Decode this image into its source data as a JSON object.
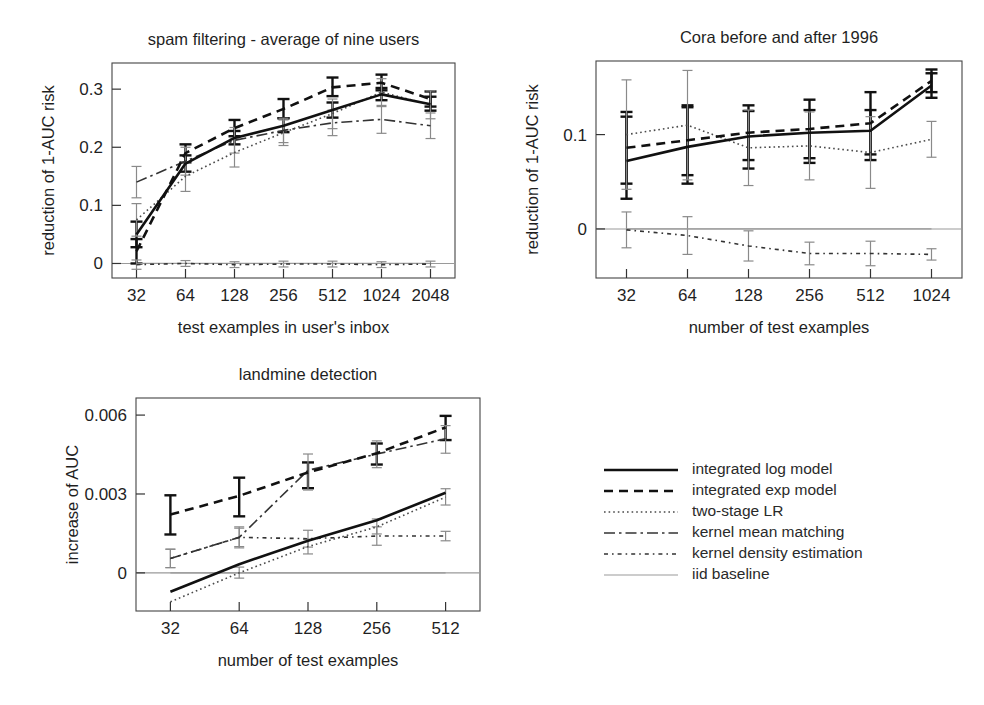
{
  "figure": {
    "width": 984,
    "height": 705,
    "background": "#ffffff"
  },
  "series_styles": {
    "integrated_log_model": {
      "color": "#111111",
      "width": 2.6,
      "dash": "none"
    },
    "integrated_exp_model": {
      "color": "#111111",
      "width": 2.6,
      "dash": "9,6"
    },
    "two_stage_lr": {
      "color": "#4a4a4a",
      "width": 1.6,
      "dash": "1.6,3"
    },
    "kernel_mean_matching": {
      "color": "#333333",
      "width": 1.6,
      "dash": "11,4,2.5,4"
    },
    "kernel_density_estimation": {
      "color": "#333333",
      "width": 1.6,
      "dash": "4,4,1.6,4"
    },
    "iid_baseline": {
      "color": "#9a9a9a",
      "width": 1.2,
      "dash": "none"
    }
  },
  "legend": {
    "x": 604,
    "y": 470,
    "row_height": 21,
    "sample_width": 74,
    "text_offset": 88,
    "items": [
      {
        "key": "integrated_log_model",
        "label": "integrated log model"
      },
      {
        "key": "integrated_exp_model",
        "label": "integrated exp model"
      },
      {
        "key": "two_stage_lr",
        "label": "two-stage LR"
      },
      {
        "key": "kernel_mean_matching",
        "label": "kernel mean matching"
      },
      {
        "key": "kernel_density_estimation",
        "label": "kernel density estimation"
      },
      {
        "key": "iid_baseline",
        "label": "iid baseline"
      }
    ]
  },
  "chart_data": [
    {
      "id": "spam-filtering",
      "type": "line",
      "title": "spam filtering - average of nine users",
      "xlabel": "test examples in user's inbox",
      "ylabel": "reduction of 1-AUC risk",
      "categories": [
        "32",
        "64",
        "128",
        "256",
        "512",
        "1024",
        "2048"
      ],
      "yticks": [
        0,
        0.1,
        0.2,
        0.3
      ],
      "ytick_labels": [
        "0",
        "0.1",
        "0.2",
        "0.3"
      ],
      "ylim": [
        -0.025,
        0.345
      ],
      "grid": false,
      "zero_line": true,
      "legend_position": "external-bottom-right",
      "plot_box": {
        "left": 112,
        "top": 63,
        "right": 455,
        "bottom": 278
      },
      "series": [
        {
          "name": "integrated log model",
          "key": "integrated_log_model",
          "values": [
            0.05,
            0.172,
            0.216,
            0.237,
            0.264,
            0.291,
            0.274
          ],
          "err_lo": [
            0.028,
            0.158,
            0.205,
            0.226,
            0.251,
            0.281,
            0.263
          ],
          "err_hi": [
            0.072,
            0.186,
            0.228,
            0.25,
            0.277,
            0.302,
            0.287
          ]
        },
        {
          "name": "integrated exp model",
          "key": "integrated_exp_model",
          "values": [
            0.021,
            0.19,
            0.233,
            0.266,
            0.303,
            0.311,
            0.283
          ],
          "err_lo": [
            0.0,
            0.174,
            0.219,
            0.25,
            0.288,
            0.298,
            0.27
          ],
          "err_hi": [
            0.042,
            0.205,
            0.247,
            0.283,
            0.32,
            0.325,
            0.296
          ]
        },
        {
          "name": "two-stage LR",
          "key": "two_stage_lr",
          "values": [
            0.075,
            0.15,
            0.191,
            0.225,
            0.258,
            0.295,
            0.273
          ],
          "err_lo": [
            0.047,
            0.124,
            0.166,
            0.203,
            0.232,
            0.272,
            0.249
          ],
          "err_hi": [
            0.103,
            0.175,
            0.214,
            0.247,
            0.283,
            0.318,
            0.297
          ]
        },
        {
          "name": "kernel mean matching",
          "key": "kernel_mean_matching",
          "values": [
            0.14,
            0.176,
            0.212,
            0.229,
            0.242,
            0.248,
            0.237
          ],
          "err_lo": [
            0.113,
            0.152,
            0.19,
            0.208,
            0.22,
            0.224,
            0.215
          ],
          "err_hi": [
            0.167,
            0.2,
            0.234,
            0.25,
            0.264,
            0.27,
            0.259
          ]
        },
        {
          "name": "kernel density estimation",
          "key": "kernel_density_estimation",
          "values": [
            -0.002,
            0.0,
            -0.002,
            -0.001,
            -0.001,
            -0.002,
            -0.001
          ],
          "err_lo": [
            -0.01,
            -0.005,
            -0.007,
            -0.006,
            -0.006,
            -0.007,
            -0.006
          ],
          "err_hi": [
            0.006,
            0.005,
            0.003,
            0.004,
            0.004,
            0.003,
            0.004
          ]
        },
        {
          "name": "iid baseline",
          "key": "iid_baseline",
          "values": [
            0,
            0,
            0,
            0,
            0,
            0,
            0
          ]
        }
      ]
    },
    {
      "id": "cora",
      "type": "line",
      "title": "Cora before and after 1996",
      "xlabel": "number of test examples",
      "ylabel": "reduction of 1-AUC risk",
      "categories": [
        "32",
        "64",
        "128",
        "256",
        "512",
        "1024"
      ],
      "yticks": [
        0,
        0.1
      ],
      "ytick_labels": [
        "0",
        "0.1"
      ],
      "ylim": [
        -0.052,
        0.178
      ],
      "grid": false,
      "zero_line": true,
      "legend_position": "external-bottom-right",
      "plot_box": {
        "left": 596,
        "top": 61,
        "right": 962,
        "bottom": 278
      },
      "series": [
        {
          "name": "integrated log model",
          "key": "integrated_log_model",
          "values": [
            0.072,
            0.087,
            0.098,
            0.102,
            0.104,
            0.152
          ],
          "err_lo": [
            0.032,
            0.048,
            0.064,
            0.07,
            0.073,
            0.139
          ],
          "err_hi": [
            0.119,
            0.129,
            0.125,
            0.126,
            0.126,
            0.165
          ]
        },
        {
          "name": "integrated exp model",
          "key": "integrated_exp_model",
          "values": [
            0.086,
            0.094,
            0.102,
            0.106,
            0.112,
            0.157
          ],
          "err_lo": [
            0.048,
            0.057,
            0.073,
            0.075,
            0.079,
            0.145
          ],
          "err_hi": [
            0.124,
            0.131,
            0.131,
            0.137,
            0.145,
            0.169
          ]
        },
        {
          "name": "two-stage LR",
          "key": "two_stage_lr",
          "values": [
            0.1,
            0.11,
            0.086,
            0.088,
            0.081,
            0.095
          ],
          "err_lo": [
            0.042,
            0.052,
            0.046,
            0.052,
            0.043,
            0.076
          ],
          "err_hi": [
            0.158,
            0.168,
            0.126,
            0.124,
            0.119,
            0.114
          ]
        },
        {
          "name": "kernel density estimation",
          "key": "kernel_density_estimation",
          "values": [
            -0.001,
            -0.007,
            -0.018,
            -0.026,
            -0.026,
            -0.027
          ],
          "err_lo": [
            -0.02,
            -0.027,
            -0.034,
            -0.038,
            -0.039,
            -0.033
          ],
          "err_hi": [
            0.018,
            0.013,
            -0.002,
            -0.014,
            -0.013,
            -0.021
          ]
        },
        {
          "name": "iid baseline",
          "key": "iid_baseline",
          "values": [
            0,
            0,
            0,
            0,
            0,
            0
          ]
        }
      ]
    },
    {
      "id": "landmine",
      "type": "line",
      "title": "landmine detection",
      "xlabel": "number of test examples",
      "ylabel": "increase of AUC",
      "categories": [
        "32",
        "64",
        "128",
        "256",
        "512"
      ],
      "yticks": [
        0,
        0.003,
        0.006
      ],
      "ytick_labels": [
        "0",
        "0.003",
        "0.006"
      ],
      "ylim": [
        -0.00145,
        0.00665
      ],
      "grid": false,
      "zero_line": true,
      "legend_position": "external-bottom-right",
      "plot_box": {
        "left": 136,
        "top": 398,
        "right": 480,
        "bottom": 611
      },
      "series": [
        {
          "name": "integrated log model",
          "key": "integrated_log_model",
          "values": [
            -0.00072,
            0.00033,
            0.00122,
            0.002,
            0.00305
          ],
          "err_lo": [
            -0.00072,
            0.00033,
            0.00122,
            0.002,
            0.00305
          ],
          "err_hi": [
            -0.00072,
            0.00033,
            0.00122,
            0.002,
            0.00305
          ]
        },
        {
          "name": "integrated exp model",
          "key": "integrated_exp_model",
          "values": [
            0.00222,
            0.00293,
            0.00382,
            0.00455,
            0.00553
          ],
          "err_lo": [
            0.00146,
            0.00215,
            0.00322,
            0.00412,
            0.00505
          ],
          "err_hi": [
            0.00295,
            0.00362,
            0.0042,
            0.00492,
            0.00597
          ]
        },
        {
          "name": "two-stage LR",
          "key": "two_stage_lr",
          "values": [
            -0.0011,
            0.0,
            0.001,
            0.00175,
            0.00288
          ],
          "err_lo": [
            -0.0011,
            -0.0002,
            0.00072,
            0.00148,
            0.00258
          ],
          "err_hi": [
            -0.0011,
            0.00022,
            0.00128,
            0.00205,
            0.0032
          ]
        },
        {
          "name": "kernel mean matching",
          "key": "kernel_mean_matching",
          "values": [
            0.00055,
            0.00135,
            0.0039,
            0.00452,
            0.0051
          ],
          "err_lo": [
            0.0002,
            0.00095,
            0.00315,
            0.004,
            0.00455
          ],
          "err_hi": [
            0.0009,
            0.00175,
            0.00452,
            0.00502,
            0.0056
          ]
        },
        {
          "name": "kernel density estimation",
          "key": "kernel_density_estimation",
          "values": [
            0.00055,
            0.00135,
            0.0013,
            0.0014,
            0.0014
          ],
          "err_lo": [
            0.0002,
            0.001,
            0.00098,
            0.00105,
            0.00122
          ],
          "err_hi": [
            0.0009,
            0.0017,
            0.00162,
            0.00175,
            0.00158
          ]
        },
        {
          "name": "iid baseline",
          "key": "iid_baseline",
          "values": [
            0,
            0,
            0,
            0,
            0
          ]
        }
      ]
    }
  ]
}
